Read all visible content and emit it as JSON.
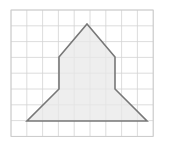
{
  "figure": {
    "canvas": {
      "width": 173,
      "height": 144,
      "background": "#ffffff"
    },
    "grid": {
      "name": "square-grid",
      "origin_x": 11,
      "origin_y": 10,
      "cell_size": 15.8,
      "columns": 9,
      "rows": 8,
      "line_color": "#d3d3d3",
      "border_color": "#c8c8c8",
      "line_width": 0.8
    },
    "shape": {
      "name": "pentagon-rocket",
      "type": "polygon",
      "fill": "#e8e8e8",
      "fill_opacity": 0.75,
      "stroke": "#777777",
      "stroke_width": 1.6,
      "vertex_labels": [
        "apex",
        "right-shoulder",
        "right-waist",
        "right-wing-tip",
        "left-wing-tip",
        "left-waist",
        "left-shoulder"
      ],
      "points": "87,24 115,57 115,89 147,121 27,121 59,89 59,57",
      "vertices": [
        {
          "label": "apex",
          "x": 87,
          "y": 24,
          "grid_x": 4.8,
          "grid_y": 0.9
        },
        {
          "label": "right-shoulder",
          "x": 115,
          "y": 57,
          "grid_x": 6.6,
          "grid_y": 3.0
        },
        {
          "label": "right-waist",
          "x": 115,
          "y": 89,
          "grid_x": 6.6,
          "grid_y": 5.0
        },
        {
          "label": "right-wing-tip",
          "x": 147,
          "y": 121,
          "grid_x": 8.6,
          "grid_y": 7.0
        },
        {
          "label": "left-wing-tip",
          "x": 27,
          "y": 121,
          "grid_x": 1.0,
          "grid_y": 7.0
        },
        {
          "label": "left-waist",
          "x": 59,
          "y": 89,
          "grid_x": 3.0,
          "grid_y": 5.0
        },
        {
          "label": "left-shoulder",
          "x": 59,
          "y": 57,
          "grid_x": 3.0,
          "grid_y": 3.0
        }
      ]
    }
  }
}
